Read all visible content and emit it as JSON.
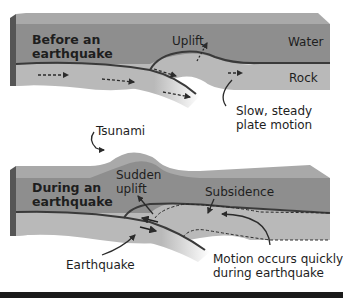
{
  "colors": {
    "water": "#8e8e8e",
    "water_top": "#a9a9a9",
    "water_side": "#555555",
    "rock": "#b9b9b9",
    "plate_line": "#3a3a3a",
    "text": "#1e1e1e",
    "background": "#ffffff"
  },
  "panels": [
    {
      "name": "before",
      "heading_line1": "Before an",
      "heading_line2": "earthquake",
      "labels": {
        "uplift": "Uplift",
        "water": "Water",
        "rock": "Rock",
        "callout_line1": "Slow, steady",
        "callout_line2": "plate motion"
      }
    },
    {
      "name": "during",
      "heading_line1": "During an",
      "heading_line2": "earthquake",
      "labels": {
        "tsunami": "Tsunami",
        "sudden_line1": "Sudden",
        "sudden_line2": "uplift",
        "subsidence": "Subsidence",
        "earthquake": "Earthquake",
        "motion_line1": "Motion occurs quickly",
        "motion_line2": "during earthquake"
      }
    }
  ]
}
